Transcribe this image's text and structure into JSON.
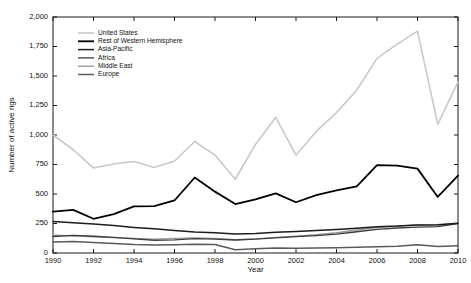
{
  "chart_data": {
    "type": "line",
    "title": "",
    "xlabel": "Year",
    "ylabel": "Number of active rigs",
    "xlim": [
      1990,
      2010
    ],
    "ylim": [
      0,
      2000
    ],
    "grid": false,
    "legend_position": "top-left",
    "x": [
      1990,
      1991,
      1992,
      1993,
      1994,
      1995,
      1996,
      1997,
      1998,
      1999,
      2000,
      2001,
      2002,
      2003,
      2004,
      2005,
      2006,
      2007,
      2008,
      2009,
      2010
    ],
    "xticks": [
      "1990",
      "1992",
      "1994",
      "1996",
      "1998",
      "2000",
      "2002",
      "2004",
      "2006",
      "2008",
      "2010"
    ],
    "xtick_values": [
      1990,
      1992,
      1994,
      1996,
      1998,
      2000,
      2002,
      2004,
      2006,
      2008,
      2010
    ],
    "yticks": [
      "0",
      "250",
      "500",
      "750",
      "1,000",
      "1,250",
      "1,500",
      "1,750",
      "2,000"
    ],
    "ytick_values": [
      0,
      250,
      500,
      750,
      1000,
      1250,
      1500,
      1750,
      2000
    ],
    "series": [
      {
        "name": "United States",
        "color": "#c9c9c9",
        "width": 1.6,
        "values": [
          1000,
          875,
          720,
          755,
          775,
          725,
          780,
          945,
          830,
          625,
          920,
          1150,
          830,
          1030,
          1190,
          1380,
          1650,
          1770,
          1880,
          1090,
          1450
        ]
      },
      {
        "name": "Rest of Western Hemisphere",
        "color": "#000000",
        "width": 1.8,
        "values": [
          350,
          365,
          290,
          330,
          395,
          397,
          445,
          640,
          520,
          415,
          455,
          505,
          430,
          490,
          530,
          565,
          745,
          740,
          715,
          475,
          655
        ]
      },
      {
        "name": "Asia-Pacific",
        "color": "#1c1c1c",
        "width": 1.5,
        "values": [
          268,
          256,
          245,
          232,
          217,
          205,
          190,
          178,
          172,
          160,
          165,
          175,
          183,
          190,
          200,
          210,
          222,
          228,
          238,
          240,
          252
        ]
      },
      {
        "name": "Africa",
        "color": "#3d3d3d",
        "width": 1.3,
        "values": [
          140,
          150,
          142,
          133,
          120,
          108,
          112,
          122,
          118,
          110,
          118,
          128,
          138,
          148,
          160,
          180,
          200,
          212,
          220,
          224,
          250
        ]
      },
      {
        "name": "Middle East",
        "color": "#9a9a9a",
        "width": 1.4,
        "values": [
          150,
          145,
          138,
          130,
          124,
          118,
          124,
          128,
          124,
          112,
          120,
          132,
          142,
          155,
          172,
          195,
          215,
          228,
          238,
          236,
          252
        ]
      },
      {
        "name": "Europe",
        "color": "#5a5a5a",
        "width": 1.5,
        "values": [
          93,
          97,
          88,
          80,
          72,
          68,
          70,
          75,
          72,
          28,
          35,
          42,
          40,
          42,
          45,
          48,
          52,
          58,
          70,
          55,
          62
        ]
      }
    ]
  }
}
